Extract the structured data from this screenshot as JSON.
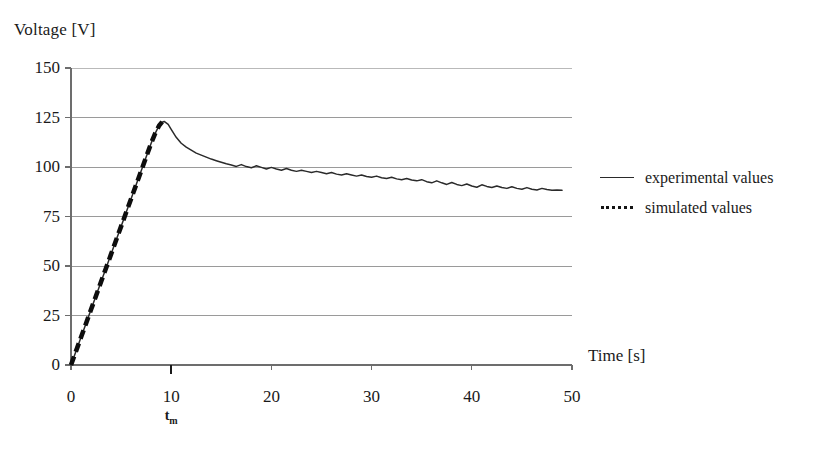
{
  "axes": {
    "y_title": "Voltage [V]",
    "x_title": "Time [s]",
    "y_ticks": [
      "150",
      "125",
      "100",
      "75",
      "50",
      "25",
      "0"
    ],
    "x_ticks": [
      "0",
      "10",
      "20",
      "30",
      "40",
      "50"
    ],
    "annotation_peak_time": "t",
    "annotation_peak_sub": "m"
  },
  "legend": {
    "items": [
      {
        "label": "experimental values",
        "style": "solid"
      },
      {
        "label": "simulated values",
        "style": "dotted"
      }
    ]
  },
  "colors": {
    "experimental": "#2a2a2a",
    "simulated": "#0d0d0d",
    "gridline": "#9a9a9a",
    "axis": "#6d6d6d",
    "background": "#ffffff"
  },
  "chart_data": {
    "type": "line",
    "title": "",
    "xlabel": "Time [s]",
    "ylabel": "Voltage [V]",
    "xlim": [
      0,
      50
    ],
    "ylim": [
      0,
      150
    ],
    "xticks": [
      0,
      10,
      20,
      30,
      40,
      50
    ],
    "yticks": [
      0,
      25,
      50,
      75,
      100,
      125,
      150
    ],
    "grid": true,
    "legend_position": "right",
    "annotations": [
      {
        "text": "t_m",
        "x": 10,
        "y": 0,
        "note": "time of maximum voltage marked on time axis"
      }
    ],
    "series": [
      {
        "name": "experimental values",
        "style": "solid",
        "x": [
          0,
          0.5,
          1,
          1.5,
          2,
          2.5,
          3,
          3.5,
          4,
          4.5,
          5,
          5.5,
          6,
          6.5,
          7,
          7.5,
          8,
          8.3,
          8.6,
          9,
          9.3,
          9.7,
          10,
          10.5,
          11,
          11.5,
          12,
          12.5,
          13,
          13.5,
          14,
          14.5,
          15,
          15.5,
          16,
          16.5,
          17,
          17.5,
          18,
          18.5,
          19,
          19.5,
          20,
          20.5,
          21,
          21.5,
          22,
          22.5,
          23,
          23.5,
          24,
          24.5,
          25,
          25.5,
          26,
          26.5,
          27,
          27.5,
          28,
          28.5,
          29,
          29.5,
          30,
          30.5,
          31,
          31.5,
          32,
          32.5,
          33,
          33.5,
          34,
          34.5,
          35,
          35.5,
          36,
          36.5,
          37,
          37.5,
          38,
          38.5,
          39,
          39.5,
          40,
          40.5,
          41,
          41.5,
          42,
          42.5,
          43,
          43.5,
          44,
          44.5,
          45,
          45.5,
          46,
          46.5,
          47,
          47.5,
          48,
          48.5,
          49
        ],
        "y": [
          0,
          7,
          14,
          21,
          28,
          35,
          42,
          49,
          56,
          63,
          70,
          77,
          84,
          91,
          98,
          105,
          112,
          116,
          119,
          122.5,
          123,
          121.5,
          119,
          115,
          112,
          110,
          108.5,
          107,
          106,
          105,
          104,
          103.2,
          102.4,
          101.6,
          101,
          100.3,
          101.2,
          100.2,
          99.6,
          100.6,
          99.8,
          99,
          99.8,
          99,
          98.4,
          99.2,
          98.4,
          97.8,
          98.4,
          97.8,
          97.2,
          97.8,
          97.2,
          96.6,
          97.2,
          96.4,
          96,
          96.6,
          96,
          95.4,
          96,
          95.2,
          94.8,
          95.4,
          94.6,
          94.2,
          94.8,
          94,
          93.6,
          94.2,
          93.4,
          93,
          93.6,
          92.6,
          92,
          93,
          92,
          91.2,
          92.2,
          91.2,
          90.6,
          91.4,
          90.4,
          89.8,
          91,
          90.2,
          89.6,
          90.4,
          89.6,
          89.2,
          90,
          89.2,
          88.8,
          89.6,
          88.8,
          88.4,
          89.2,
          88.6,
          88.2,
          88.4,
          88.2
        ]
      },
      {
        "name": "simulated values",
        "style": "dotted",
        "x": [
          0,
          0.5,
          1,
          1.5,
          2,
          2.5,
          3,
          3.5,
          4,
          4.5,
          5,
          5.5,
          6,
          6.5,
          7,
          7.5,
          8,
          8.4,
          8.8,
          9.1
        ],
        "y": [
          0,
          7,
          14,
          21,
          28,
          35,
          42,
          49,
          56,
          63,
          70,
          77,
          84,
          91,
          98,
          105,
          112,
          117,
          121,
          122.8
        ]
      }
    ]
  },
  "geometry": {
    "plot_left": 71,
    "plot_right": 572,
    "plot_top": 68,
    "plot_bottom": 365
  }
}
